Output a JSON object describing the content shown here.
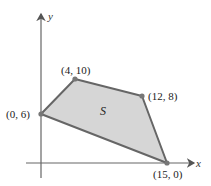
{
  "diagram": {
    "type": "feasible-region",
    "axes": {
      "x_label": "x",
      "y_label": "y"
    },
    "region": {
      "label": "S",
      "fill_color": "#d6d6d6",
      "stroke_color": "#666666",
      "vertices": [
        {
          "label": "(0, 6)",
          "x": 0,
          "y": 6
        },
        {
          "label": "(4, 10)",
          "x": 4,
          "y": 10
        },
        {
          "label": "(12, 8)",
          "x": 12,
          "y": 8
        },
        {
          "label": "(15, 0)",
          "x": 15,
          "y": 0
        }
      ]
    }
  }
}
